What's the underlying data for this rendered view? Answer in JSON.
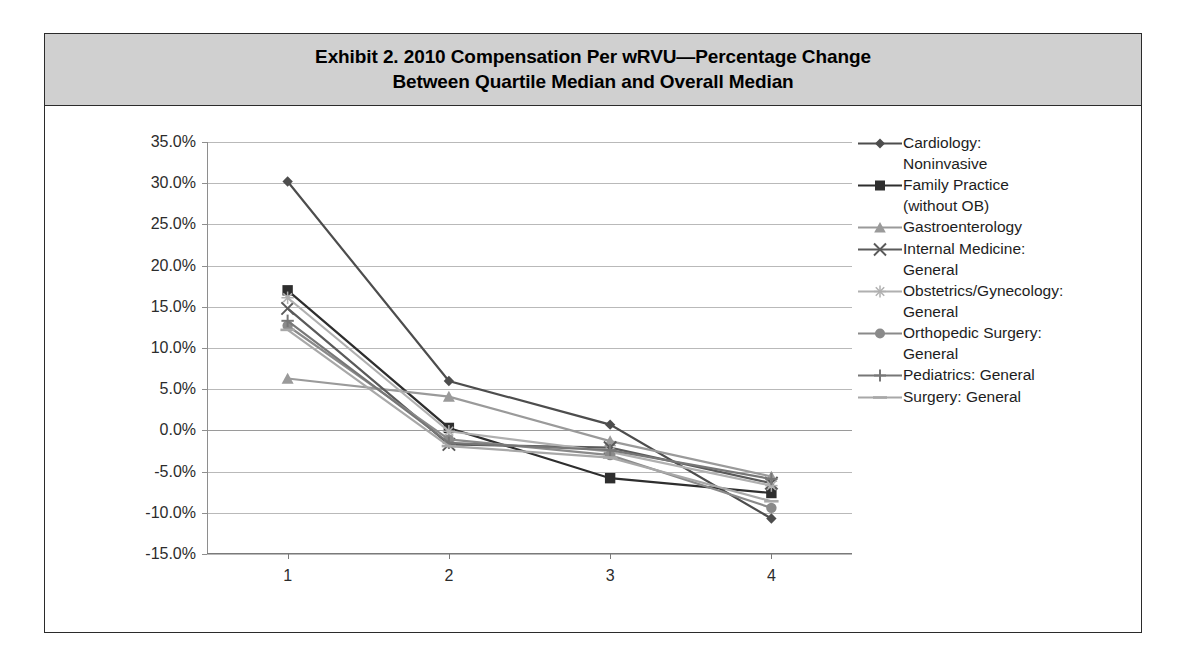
{
  "title": {
    "line1": "Exhibit 2. 2010 Compensation Per wRVU—Percentage Change",
    "line2": "Between Quartile Median and Overall Median"
  },
  "chart_data": {
    "type": "line",
    "title": "Exhibit 2. 2010 Compensation Per wRVU—Percentage Change Between Quartile Median and Overall Median",
    "xlabel": "",
    "ylabel": "",
    "categories": [
      "1",
      "2",
      "3",
      "4"
    ],
    "ylim": [
      -15,
      35
    ],
    "ytick_labels": [
      "35.0%",
      "30.0%",
      "25.0%",
      "20.0%",
      "15.0%",
      "10.0%",
      "5.0%",
      "0.0%",
      "-5.0%",
      "-10.0%",
      "-15.0%"
    ],
    "ytick_values": [
      35,
      30,
      25,
      20,
      15,
      10,
      5,
      0,
      -5,
      -10,
      -15
    ],
    "grid": true,
    "legend_position": "right",
    "series": [
      {
        "name": "Cardiology:\nNoninvasive",
        "marker": "diamond-marker",
        "color": "#4d4d4d",
        "values": [
          30.2,
          6.0,
          0.7,
          -10.7
        ]
      },
      {
        "name": "Family Practice\n(without OB)",
        "marker": "square-marker",
        "color": "#2e2e2e",
        "values": [
          17.0,
          0.3,
          -5.8,
          -7.6
        ]
      },
      {
        "name": "Gastroenterology",
        "marker": "triangle-marker",
        "color": "#9a9a9a",
        "values": [
          6.3,
          4.1,
          -1.3,
          -5.6
        ]
      },
      {
        "name": "Internal Medicine:\nGeneral",
        "marker": "x-cross-marker",
        "color": "#5a5a5a",
        "values": [
          14.8,
          -1.7,
          -2.1,
          -6.4
        ]
      },
      {
        "name": "Obstetrics/Gynecology:\nGeneral",
        "marker": "star-marker",
        "color": "#b0b0b0",
        "values": [
          16.1,
          -0.1,
          -2.6,
          -6.7
        ]
      },
      {
        "name": "Orthopedic Surgery:\nGeneral",
        "marker": "circle-marker",
        "color": "#8a8a8a",
        "values": [
          12.7,
          -1.1,
          -3.0,
          -9.4
        ]
      },
      {
        "name": "Pediatrics: General",
        "marker": "plus-marker",
        "color": "#777777",
        "values": [
          13.3,
          -1.5,
          -2.4,
          -5.9
        ]
      },
      {
        "name": "Surgery: General",
        "marker": "line-marker",
        "color": "#a8a8a8",
        "values": [
          12.2,
          -1.9,
          -3.3,
          -8.6
        ]
      }
    ]
  }
}
